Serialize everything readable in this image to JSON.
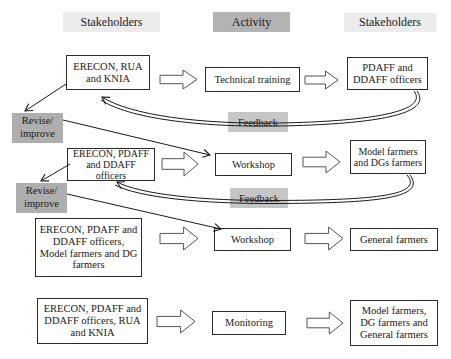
{
  "headers": {
    "stakeholders_left": "Stakeholders",
    "activity": "Activity",
    "stakeholders_right": "Stakeholders"
  },
  "rows": [
    {
      "stakeholders_left": "ERECON, RUA and KNIA",
      "activity": "Technical training",
      "stakeholders_right": "PDAFF and DDAFF officers"
    },
    {
      "stakeholders_left": "ERECON, PDAFF and DDAFF officers",
      "activity": "Workshop",
      "stakeholders_right": "Model farmers and DGs farmers"
    },
    {
      "stakeholders_left": "ERECON, PDAFF and DDAFF officers, Model farmers and DG farmers",
      "activity": "Workshop",
      "stakeholders_right": "General farmers"
    },
    {
      "stakeholders_left": "ERECON, PDAFF and DDAFF officers, RUA and KNIA",
      "activity": "Monitoring",
      "stakeholders_right": "Model farmers, DG farmers and General farmers"
    }
  ],
  "labels": {
    "feedback1": "Feedback",
    "feedback2": "Feedback",
    "revise1_line1": "Revise/",
    "revise1_line2": "improve",
    "revise2_line1": "Revise/",
    "revise2_line2": "improve"
  },
  "colors": {
    "header_light": "#ececec",
    "header_dark": "#b3b3b3",
    "label_gray": "#aeaeae",
    "feedback_gray": "#c6c6c6",
    "box_border": "#2b2b2b",
    "line": "#1a1a1a"
  }
}
